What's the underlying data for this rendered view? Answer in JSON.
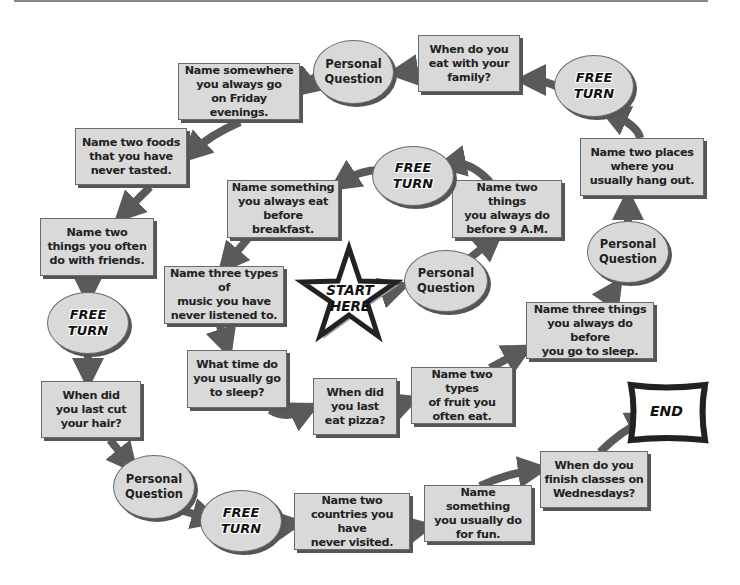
{
  "board": {
    "start": {
      "label": "START\nHERE"
    },
    "end": {
      "label": "END"
    },
    "spaces": [
      {
        "id": "s1",
        "type": "oval",
        "label": "Personal\nQuestion",
        "x": 404,
        "y": 250,
        "w": 84,
        "h": 62
      },
      {
        "id": "s2",
        "type": "box",
        "label": "Name two things\nyou always do\nbefore 9 A.M.",
        "x": 452,
        "y": 180,
        "w": 110,
        "h": 58
      },
      {
        "id": "s3",
        "type": "oval-free",
        "label": "FREE\nTURN",
        "x": 372,
        "y": 146,
        "w": 82,
        "h": 60
      },
      {
        "id": "s4",
        "type": "box",
        "label": "Name something\nyou always eat\nbefore breakfast.",
        "x": 227,
        "y": 180,
        "w": 112,
        "h": 58
      },
      {
        "id": "s5",
        "type": "box",
        "label": "Name three types of\nmusic you have\nnever listened to.",
        "x": 164,
        "y": 266,
        "w": 120,
        "h": 58
      },
      {
        "id": "s6",
        "type": "box",
        "label": "What time do\nyou usually go\nto sleep?",
        "x": 187,
        "y": 350,
        "w": 100,
        "h": 58
      },
      {
        "id": "s7",
        "type": "box",
        "label": "When did\nyou last\neat pizza?",
        "x": 313,
        "y": 378,
        "w": 84,
        "h": 57
      },
      {
        "id": "s8",
        "type": "box",
        "label": "Name two types\nof fruit you\noften eat.",
        "x": 411,
        "y": 367,
        "w": 102,
        "h": 57
      },
      {
        "id": "s9",
        "type": "box",
        "label": "Name three things\nyou always do before\nyou go to sleep.",
        "x": 526,
        "y": 302,
        "w": 128,
        "h": 57
      },
      {
        "id": "s10",
        "type": "oval",
        "label": "Personal\nQuestion",
        "x": 587,
        "y": 221,
        "w": 82,
        "h": 62
      },
      {
        "id": "s11",
        "type": "box",
        "label": "Name two places\nwhere you\nusually hang out.",
        "x": 580,
        "y": 138,
        "w": 124,
        "h": 58
      },
      {
        "id": "s12",
        "type": "oval-free",
        "label": "FREE\nTURN",
        "x": 554,
        "y": 55,
        "w": 80,
        "h": 62
      },
      {
        "id": "s13",
        "type": "box",
        "label": "When do you\neat with your\nfamily?",
        "x": 418,
        "y": 35,
        "w": 102,
        "h": 57
      },
      {
        "id": "s14",
        "type": "oval",
        "label": "Personal\nQuestion",
        "x": 313,
        "y": 40,
        "w": 81,
        "h": 64
      },
      {
        "id": "s15",
        "type": "box",
        "label": "Name somewhere\nyou always go\non Friday evenings.",
        "x": 178,
        "y": 63,
        "w": 122,
        "h": 57
      },
      {
        "id": "s16",
        "type": "box",
        "label": "Name two foods\nthat you have\nnever tasted.",
        "x": 75,
        "y": 128,
        "w": 112,
        "h": 57
      },
      {
        "id": "s17",
        "type": "box",
        "label": "Name two\nthings you often\ndo with friends.",
        "x": 40,
        "y": 218,
        "w": 114,
        "h": 58
      },
      {
        "id": "s18",
        "type": "oval-free",
        "label": "FREE\nTURN",
        "x": 47,
        "y": 292,
        "w": 82,
        "h": 62
      },
      {
        "id": "s19",
        "type": "box",
        "label": "When did\nyou last cut\nyour hair?",
        "x": 41,
        "y": 381,
        "w": 100,
        "h": 57
      },
      {
        "id": "s20",
        "type": "oval",
        "label": "Personal\nQuestion",
        "x": 113,
        "y": 455,
        "w": 82,
        "h": 64
      },
      {
        "id": "s21",
        "type": "oval-free",
        "label": "FREE\nTURN",
        "x": 200,
        "y": 490,
        "w": 82,
        "h": 62
      },
      {
        "id": "s22",
        "type": "box",
        "label": "Name two\ncountries you have\nnever visited.",
        "x": 294,
        "y": 493,
        "w": 116,
        "h": 57
      },
      {
        "id": "s23",
        "type": "box",
        "label": "Name something\nyou usually do\nfor fun.",
        "x": 424,
        "y": 485,
        "w": 108,
        "h": 57
      },
      {
        "id": "s24",
        "type": "box",
        "label": "When do you\nfinish classes on\nWednesdays?",
        "x": 540,
        "y": 451,
        "w": 108,
        "h": 57
      }
    ]
  },
  "colors": {
    "space_fill": "#d9d9d9",
    "border": "#6a6a6a",
    "arrow": "#5a5a5a",
    "shadow": "#555555",
    "outline": "#222222"
  }
}
